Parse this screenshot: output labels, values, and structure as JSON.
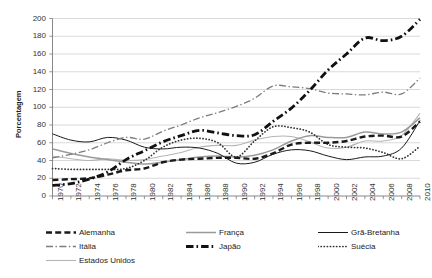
{
  "chart_data": {
    "type": "line",
    "title": "",
    "xlabel": "",
    "ylabel": "Porcentagem",
    "xlim": [
      1970,
      2010
    ],
    "ylim": [
      0,
      200
    ],
    "ytick_step": 20,
    "xtick_step": 2,
    "grid": true,
    "legend_position": "bottom",
    "yticks": [
      "0",
      "20",
      "40",
      "60",
      "80",
      "100",
      "120",
      "140",
      "160",
      "180",
      "200"
    ],
    "x": [
      1970,
      1972,
      1974,
      1976,
      1978,
      1980,
      1982,
      1984,
      1986,
      1988,
      1990,
      1992,
      1994,
      1996,
      1998,
      2000,
      2002,
      2004,
      2006,
      2008,
      2010
    ],
    "xticks": [
      "1970",
      "1972",
      "1974",
      "1976",
      "1978",
      "1980",
      "1982",
      "1984",
      "1986",
      "1988",
      "1990",
      "1992",
      "1994",
      "1996",
      "1998",
      "2000",
      "2002",
      "2004",
      "2006",
      "2008",
      "2010"
    ],
    "series": [
      {
        "name": "Alemanha",
        "style": "dashed-thick",
        "color": "#1a1a1a",
        "values": [
          18,
          19,
          20,
          24,
          29,
          31,
          38,
          41,
          42,
          43,
          43,
          42,
          48,
          58,
          60,
          60,
          62,
          67,
          68,
          67,
          84
        ]
      },
      {
        "name": "França",
        "style": "solid-medium-gray",
        "color": "#9a9a9a",
        "values": [
          53,
          48,
          44,
          41,
          38,
          36,
          38,
          41,
          44,
          45,
          44,
          46,
          52,
          62,
          68,
          66,
          66,
          72,
          70,
          72,
          88
        ]
      },
      {
        "name": "Grã-Bretanha",
        "style": "solid-thin-black",
        "color": "#1a1a1a",
        "values": [
          70,
          63,
          61,
          66,
          63,
          55,
          53,
          55,
          54,
          48,
          37,
          38,
          47,
          52,
          51,
          45,
          41,
          44,
          45,
          54,
          85
        ]
      },
      {
        "name": "Itália",
        "style": "dash-dot-gray",
        "color": "#7d7d7d",
        "values": [
          43,
          47,
          52,
          60,
          66,
          64,
          73,
          80,
          88,
          94,
          101,
          110,
          124,
          123,
          121,
          116,
          115,
          114,
          117,
          115,
          133
        ]
      },
      {
        "name": "Japão",
        "style": "dash-dot-thick-black",
        "color": "#111111",
        "values": [
          12,
          14,
          19,
          27,
          41,
          51,
          61,
          68,
          74,
          71,
          68,
          69,
          84,
          99,
          119,
          142,
          160,
          178,
          175,
          180,
          199
        ]
      },
      {
        "name": "Suécia",
        "style": "dotted",
        "color": "#333333",
        "values": [
          31,
          30,
          30,
          30,
          31,
          40,
          55,
          63,
          65,
          60,
          44,
          62,
          78,
          77,
          72,
          58,
          55,
          54,
          49,
          42,
          56
        ]
      },
      {
        "name": "Estados Unidos",
        "style": "solid-thin-gray",
        "color": "#b5b5b5",
        "values": [
          45,
          42,
          40,
          42,
          40,
          41,
          45,
          49,
          55,
          57,
          57,
          63,
          67,
          67,
          61,
          54,
          55,
          62,
          62,
          68,
          93
        ]
      }
    ]
  },
  "legend": {
    "items": [
      {
        "label": "Alemanha",
        "style": "dashed-thick",
        "color": "#1a1a1a"
      },
      {
        "label": "França",
        "style": "solid-medium-gray",
        "color": "#9a9a9a"
      },
      {
        "label": "Grã-Bretanha",
        "style": "solid-thin-black",
        "color": "#1a1a1a"
      },
      {
        "label": "Itália",
        "style": "dash-dot-gray",
        "color": "#7d7d7d"
      },
      {
        "label": "Japão",
        "style": "dash-dot-thick-black",
        "color": "#111111"
      },
      {
        "label": "Suécia",
        "style": "dotted",
        "color": "#333333"
      },
      {
        "label": "Estados Unidos",
        "style": "solid-thin-gray",
        "color": "#b5b5b5"
      }
    ]
  },
  "axes": {
    "y_title": "Porcentagem"
  }
}
